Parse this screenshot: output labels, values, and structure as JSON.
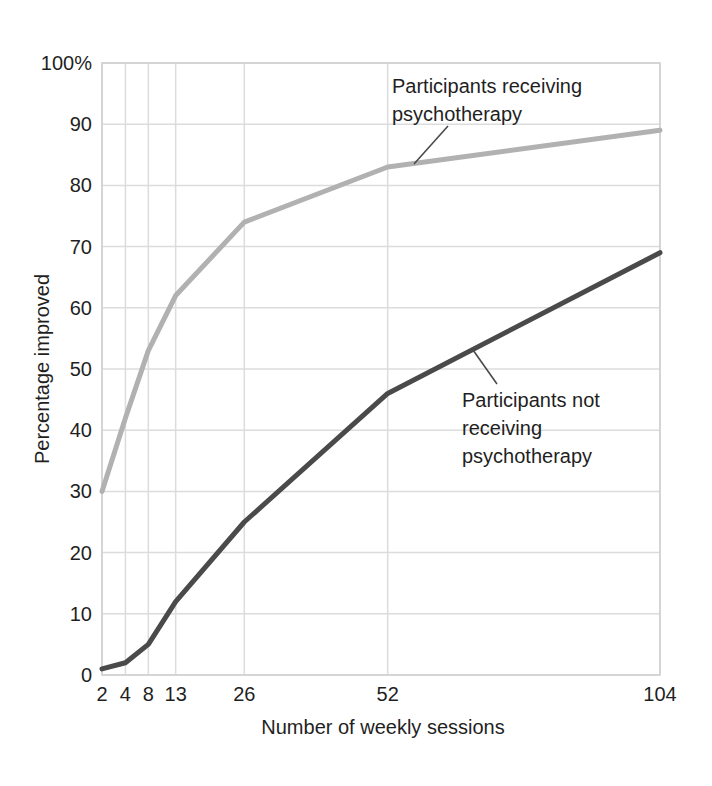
{
  "chart_data": {
    "type": "line",
    "title": "",
    "xlabel": "Number of weekly sessions",
    "ylabel": "Percentage improved",
    "x_ticks": [
      2,
      4,
      8,
      13,
      26,
      52,
      104
    ],
    "x_tick_labels": [
      "2",
      "4",
      "8",
      "13",
      "26",
      "52",
      "104"
    ],
    "x_tick_fractions": [
      0,
      0.042,
      0.083,
      0.132,
      0.255,
      0.512,
      1.0
    ],
    "y_ticks": [
      0,
      10,
      20,
      30,
      40,
      50,
      60,
      70,
      80,
      90,
      100
    ],
    "y_tick_labels": [
      "0",
      "10",
      "20",
      "30",
      "40",
      "50",
      "60",
      "70",
      "80",
      "90",
      "100%"
    ],
    "ylim": [
      0,
      100
    ],
    "grid": true,
    "legend_position": "inline-annotations",
    "series": [
      {
        "name": "Participants receiving psychotherapy",
        "color": "#b1b1b1",
        "values": [
          30,
          42,
          53,
          62,
          74,
          83,
          89
        ]
      },
      {
        "name": "Participants not receiving psychotherapy",
        "color": "#4a4a4a",
        "values": [
          1,
          2,
          5,
          12,
          25,
          46,
          69
        ]
      }
    ],
    "annotations": [
      {
        "text": "Participants receiving\npsychotherapy",
        "leader_px": {
          "x1": 414,
          "y1": 164,
          "x2": 448,
          "y2": 126
        }
      },
      {
        "text": "Participants not\nreceiving\npsychotherapy",
        "leader_px": {
          "x1": 473,
          "y1": 350,
          "x2": 497,
          "y2": 384
        }
      }
    ],
    "colors": {
      "grid": "#dcdcdc",
      "border": "#cfcfcf",
      "leader": "#4a4a4a",
      "text": "#1f1f1f",
      "background": "#ffffff"
    }
  }
}
